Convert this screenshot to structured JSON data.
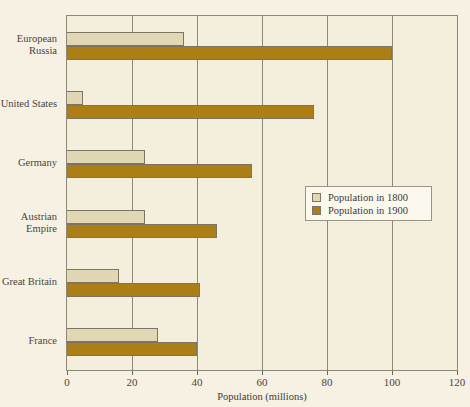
{
  "chart_data": {
    "type": "bar",
    "orientation": "horizontal",
    "title": "",
    "xlabel": "Population (millions)",
    "ylabel": "",
    "xlim": [
      0,
      120
    ],
    "xticks": [
      0,
      20,
      40,
      60,
      80,
      100,
      120
    ],
    "grid": true,
    "grid_axis": "x",
    "legend_position": "center-right",
    "categories": [
      "European Russia",
      "United States",
      "Germany",
      "Austrian Empire",
      "Great Britain",
      "France"
    ],
    "category_label_lines": [
      [
        "European",
        "Russia"
      ],
      [
        "United States"
      ],
      [
        "Germany"
      ],
      [
        "Austrian",
        "Empire"
      ],
      [
        "Great Britain"
      ],
      [
        "France"
      ]
    ],
    "series": [
      {
        "name": "Population in 1800",
        "color": "#E2D7B4",
        "values": [
          36,
          5,
          24,
          24,
          16,
          28
        ]
      },
      {
        "name": "Population in 1900",
        "color": "#AC7F16",
        "values": [
          100,
          76,
          57,
          46,
          41,
          40
        ]
      }
    ]
  },
  "legend": {
    "entries": [
      {
        "label": "Population in 1800"
      },
      {
        "label": "Population in 1900"
      }
    ]
  },
  "axis": {
    "x_title": "Population (millions)",
    "tick_labels": [
      "0",
      "20",
      "40",
      "60",
      "80",
      "100",
      "120"
    ]
  },
  "colors": {
    "page_background": "#F6F1E2",
    "plot_background": "#F4EEDC",
    "frame": "#8e8878",
    "series_1800": "#E2D7B4",
    "series_1900": "#AC7F16",
    "text": "#4a453c"
  }
}
